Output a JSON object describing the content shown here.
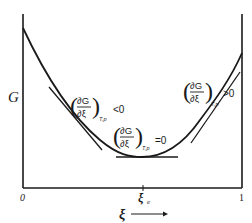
{
  "diagram": {
    "type": "gibbs-energy-vs-extent-of-reaction",
    "y_axis_label": "G",
    "x_axis_label": "ξ",
    "x_axis_arrow": "→",
    "x_ticks": [
      {
        "label": "0",
        "position": 0
      },
      {
        "label": "ξ",
        "subscript": "e",
        "position": 0.55
      },
      {
        "label": "1",
        "position": 1
      }
    ],
    "annotations": [
      {
        "id": "left",
        "numerator": "∂G",
        "denominator": "∂ξ",
        "subscript": "T,p",
        "relation": "<0"
      },
      {
        "id": "min",
        "numerator": "∂G",
        "denominator": "∂ξ",
        "subscript": "T,p",
        "relation": "=0"
      },
      {
        "id": "right",
        "numerator": "∂G",
        "denominator": "∂ξ",
        "subscript": "T,p",
        "relation": ">0"
      }
    ],
    "colors": {
      "line": "#1a1a1a",
      "background": "#ffffff"
    }
  }
}
